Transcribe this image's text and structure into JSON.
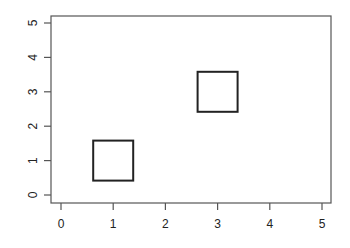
{
  "chart_data": {
    "type": "scatter",
    "title": "",
    "xlabel": "",
    "ylabel": "",
    "xlim": [
      0,
      5
    ],
    "ylim": [
      0,
      5
    ],
    "grid": false,
    "legend": null,
    "x_ticks": [
      "0",
      "1",
      "2",
      "3",
      "4",
      "5"
    ],
    "y_ticks": [
      "0",
      "1",
      "2",
      "3",
      "4",
      "5"
    ],
    "series": [
      {
        "name": "points",
        "marker": "open-square",
        "color": "#222222",
        "x": [
          1,
          3
        ],
        "y": [
          1,
          3
        ]
      }
    ]
  }
}
